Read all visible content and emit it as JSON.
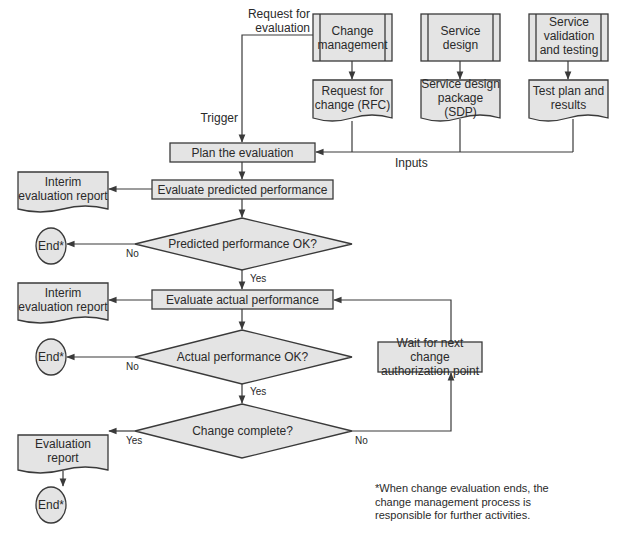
{
  "colors": {
    "fill": "#e4e4e4",
    "stroke": "#3a3a3a",
    "text": "#2a2a2a",
    "background": "#ffffff"
  },
  "sources": [
    {
      "label": "Change management"
    },
    {
      "label": "Service design"
    },
    {
      "label": "Service validation and testing"
    }
  ],
  "inputs_docs": [
    {
      "label": "Request for change (RFC)"
    },
    {
      "label": "Service design package (SDP)"
    },
    {
      "label": "Test plan and results"
    }
  ],
  "edge_labels": {
    "request_for_evaluation": "Request for evaluation",
    "trigger": "Trigger",
    "inputs": "Inputs",
    "no1": "No",
    "yes1": "Yes",
    "no2": "No",
    "yes2": "Yes",
    "yes3": "Yes",
    "no3": "No"
  },
  "process": {
    "plan": "Plan the evaluation",
    "evaluate_predicted": "Evaluate predicted performance",
    "evaluate_actual": "Evaluate actual performance",
    "wait": "Wait for next change authorization point"
  },
  "decisions": {
    "predicted_ok": "Predicted performance OK?",
    "actual_ok": "Actual performance OK?",
    "change_complete": "Change complete?"
  },
  "outputs": {
    "interim1": "Interim evaluation report",
    "interim2": "Interim evaluation report",
    "final": "Evaluation report"
  },
  "terminals": {
    "end1": "End*",
    "end2": "End*",
    "end3": "End*"
  },
  "footnote": "*When change evaluation ends, the change management process is responsible for further activities."
}
